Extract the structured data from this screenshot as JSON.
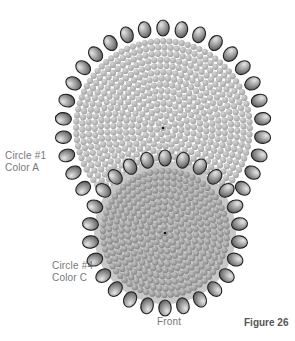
{
  "figure": {
    "title": "Figure 26",
    "view_label": "Front",
    "labels": [
      {
        "id": "circle1",
        "line1": "Circle #1",
        "line2": "Color A"
      },
      {
        "id": "circle4",
        "line1": "Circle #4",
        "line2": "Color C"
      }
    ],
    "circles": [
      {
        "name": "Circle #1",
        "color_name": "Color A",
        "cx": 163,
        "cy": 128,
        "r": 100,
        "fill_bead": "#b4b4b4",
        "edge_beads": 34
      },
      {
        "name": "Circle #4",
        "color_name": "Color C",
        "cx": 165,
        "cy": 233,
        "r": 75,
        "fill_bead": "#9a9a9a",
        "edge_beads": 26
      }
    ],
    "colors": {
      "bead_outline": "#222222",
      "edge_bead": "#8a8a8a",
      "text": "#777777"
    }
  }
}
